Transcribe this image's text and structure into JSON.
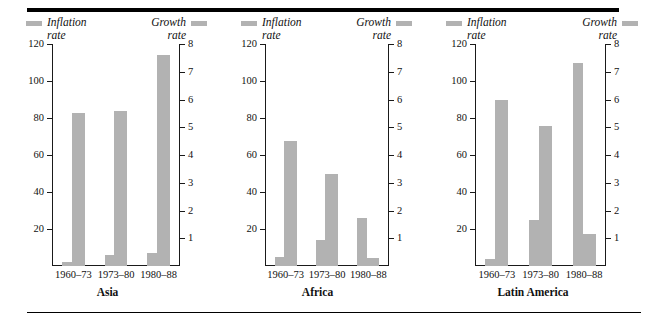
{
  "figure": {
    "bar_color": "#b2b2b2",
    "axis_color": "#1a1a1a",
    "rule_color": "#000000"
  },
  "legend": {
    "inflation_label": "Inflation\nrate",
    "growth_label": "Growth\nrate"
  },
  "chart_data": [
    {
      "type": "bar",
      "title": "Asia",
      "xlabel": "",
      "ylabel": "",
      "categories": [
        "1960–73",
        "1973–80",
        "1980–88"
      ],
      "series": [
        {
          "name": "Inflation rate",
          "axis": "left",
          "values": [
            2,
            6,
            7
          ]
        },
        {
          "name": "Growth rate",
          "axis": "right",
          "values": [
            5.5,
            5.6,
            7.6
          ]
        }
      ],
      "ylim": [
        0,
        120
      ],
      "yticks": [
        20,
        40,
        60,
        80,
        100,
        120
      ],
      "y2lim": [
        0,
        8
      ],
      "y2ticks": [
        1,
        2,
        3,
        4,
        5,
        6,
        7,
        8
      ],
      "grid": false,
      "legend": "top"
    },
    {
      "type": "bar",
      "title": "Africa",
      "xlabel": "",
      "ylabel": "",
      "categories": [
        "1960–73",
        "1973–80",
        "1980–88"
      ],
      "series": [
        {
          "name": "Inflation rate",
          "axis": "left",
          "values": [
            5,
            14,
            26
          ]
        },
        {
          "name": "Growth rate",
          "axis": "right",
          "values": [
            4.5,
            3.3,
            0.3
          ]
        }
      ],
      "ylim": [
        0,
        120
      ],
      "yticks": [
        20,
        40,
        60,
        80,
        100,
        120
      ],
      "y2lim": [
        0,
        8
      ],
      "y2ticks": [
        1,
        2,
        3,
        4,
        5,
        6,
        7,
        8
      ],
      "grid": false,
      "legend": "top"
    },
    {
      "type": "bar",
      "title": "Latin America",
      "xlabel": "",
      "ylabel": "",
      "categories": [
        "1960–73",
        "1973–80",
        "1980–88"
      ],
      "series": [
        {
          "name": "Inflation rate",
          "axis": "left",
          "values": [
            4,
            25,
            110
          ]
        },
        {
          "name": "Growth rate",
          "axis": "right",
          "values": [
            6.0,
            5.05,
            1.15
          ]
        }
      ],
      "ylim": [
        0,
        120
      ],
      "yticks": [
        20,
        40,
        60,
        80,
        100,
        120
      ],
      "y2lim": [
        0,
        8
      ],
      "y2ticks": [
        1,
        2,
        3,
        4,
        5,
        6,
        7,
        8
      ],
      "grid": false,
      "legend": "top"
    }
  ]
}
